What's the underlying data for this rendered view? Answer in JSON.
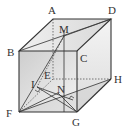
{
  "diagram": {
    "type": "cube",
    "vertices": {
      "A": {
        "label": "A",
        "x": 53,
        "y": 19
      },
      "D": {
        "label": "D",
        "x": 111,
        "y": 19
      },
      "B": {
        "label": "B",
        "x": 19,
        "y": 51
      },
      "C": {
        "label": "C",
        "x": 77,
        "y": 51
      },
      "E": {
        "label": "E",
        "x": 53,
        "y": 79
      },
      "H": {
        "label": "H",
        "x": 111,
        "y": 79
      },
      "F": {
        "label": "F",
        "x": 19,
        "y": 112
      },
      "G": {
        "label": "G",
        "x": 77,
        "y": 112
      }
    },
    "points": {
      "M": {
        "label": "M",
        "x": 64,
        "y": 36
      },
      "I": {
        "label": "I",
        "x": 37,
        "y": 87
      },
      "N": {
        "label": "N",
        "x": 58,
        "y": 93
      }
    },
    "labels": {
      "A": "A",
      "B": "B",
      "C": "C",
      "D": "D",
      "E": "E",
      "F": "F",
      "G": "G",
      "H": "H",
      "M": "M",
      "I": "I",
      "N": "N"
    },
    "colors": {
      "edge": "#333333",
      "hidden_edge": "#555555",
      "front_face": "#d4d4d4",
      "top_face": "#e6e6e6",
      "right_face": "#ececec",
      "label": "#333333"
    }
  }
}
